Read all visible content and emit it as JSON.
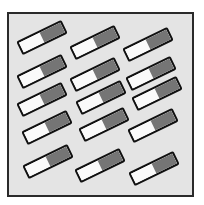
{
  "figure": {
    "frame": {
      "left": 7,
      "top": 12,
      "width": 183,
      "height": 181,
      "background": "#e4e4e4",
      "border": "#2a2a2a"
    },
    "tile_style": {
      "width": 50,
      "height": 15,
      "light_color": "#fafafa",
      "dark_color": "#757575",
      "border_color": "#111111"
    },
    "rows": 5,
    "columns": 3,
    "tiles": [
      {
        "row": 1,
        "col": 1,
        "cx": 42,
        "cy": 37,
        "angle": -26
      },
      {
        "row": 1,
        "col": 2,
        "cx": 95,
        "cy": 42,
        "angle": -26
      },
      {
        "row": 1,
        "col": 3,
        "cx": 148,
        "cy": 44,
        "angle": -26
      },
      {
        "row": 2,
        "col": 1,
        "cx": 42,
        "cy": 71,
        "angle": -26
      },
      {
        "row": 2,
        "col": 2,
        "cx": 95,
        "cy": 74,
        "angle": -26
      },
      {
        "row": 2,
        "col": 3,
        "cx": 151,
        "cy": 73,
        "angle": -26
      },
      {
        "row": 3,
        "col": 1,
        "cx": 42,
        "cy": 99,
        "angle": -26
      },
      {
        "row": 3,
        "col": 2,
        "cx": 101,
        "cy": 97,
        "angle": -26
      },
      {
        "row": 3,
        "col": 3,
        "cx": 157,
        "cy": 93,
        "angle": -26
      },
      {
        "row": 4,
        "col": 1,
        "cx": 47,
        "cy": 127,
        "angle": -26
      },
      {
        "row": 4,
        "col": 2,
        "cx": 104,
        "cy": 124,
        "angle": -26
      },
      {
        "row": 4,
        "col": 3,
        "cx": 153,
        "cy": 125,
        "angle": -26
      },
      {
        "row": 5,
        "col": 1,
        "cx": 48,
        "cy": 161,
        "angle": -26
      },
      {
        "row": 5,
        "col": 2,
        "cx": 100,
        "cy": 165,
        "angle": -26
      },
      {
        "row": 5,
        "col": 3,
        "cx": 154,
        "cy": 168,
        "angle": -26
      }
    ]
  }
}
